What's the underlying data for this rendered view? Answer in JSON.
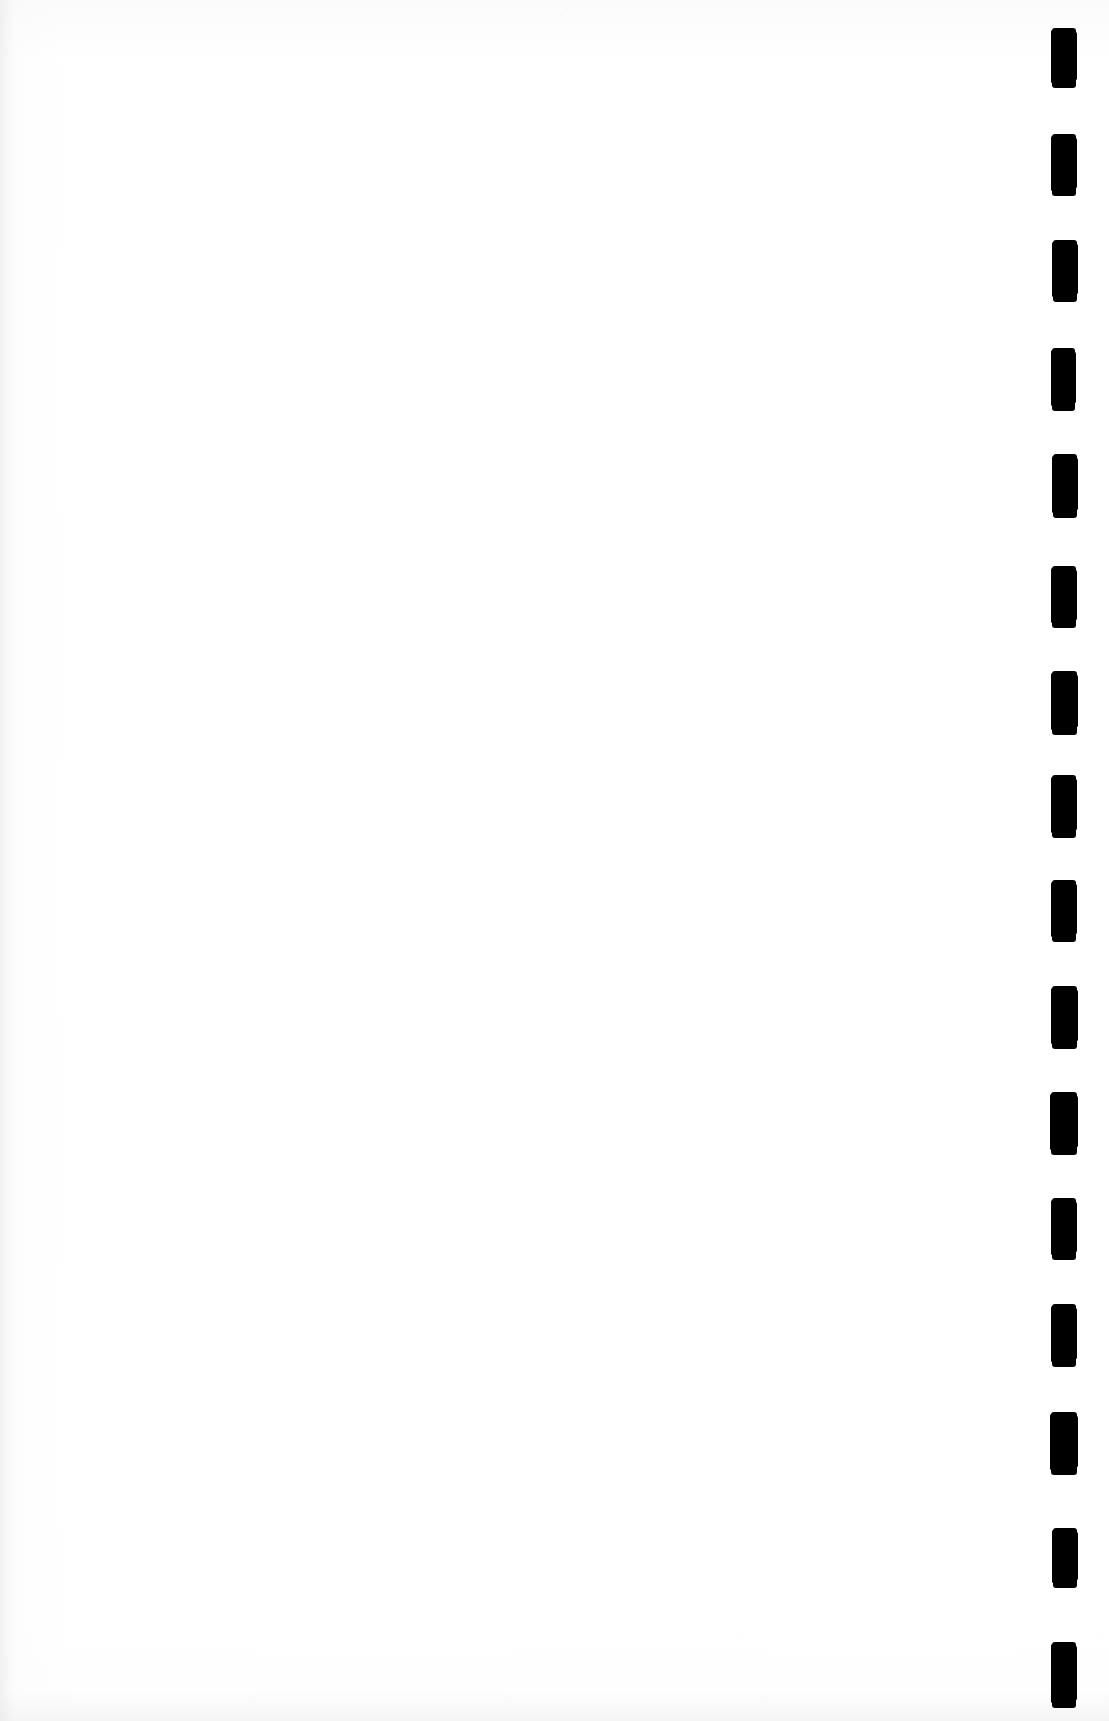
{
  "page": {
    "width": 1109,
    "height": 1721,
    "background_color": "#ffffff",
    "kind": "scanned-document-page",
    "content_text": "",
    "is_blank": true
  },
  "document_body": {
    "name": "blank-page-content",
    "text": ""
  },
  "registration_marks": {
    "name": "edge-registration-marks",
    "count": 16,
    "color": "#000000",
    "orientation": "vertical-column-right-edge",
    "mark_width": 24,
    "mark_height": 62,
    "column_left": 1052,
    "pitch": 105,
    "marks": [
      {
        "index": 1,
        "x": 1052,
        "y": 28,
        "w": 24,
        "h": 60
      },
      {
        "index": 2,
        "x": 1052,
        "y": 134,
        "w": 24,
        "h": 62
      },
      {
        "index": 3,
        "x": 1053,
        "y": 240,
        "w": 24,
        "h": 62
      },
      {
        "index": 4,
        "x": 1052,
        "y": 348,
        "w": 23,
        "h": 63
      },
      {
        "index": 5,
        "x": 1053,
        "y": 454,
        "w": 24,
        "h": 64
      },
      {
        "index": 6,
        "x": 1052,
        "y": 566,
        "w": 24,
        "h": 62
      },
      {
        "index": 7,
        "x": 1052,
        "y": 671,
        "w": 25,
        "h": 64
      },
      {
        "index": 8,
        "x": 1052,
        "y": 775,
        "w": 24,
        "h": 63
      },
      {
        "index": 9,
        "x": 1052,
        "y": 880,
        "w": 24,
        "h": 62
      },
      {
        "index": 10,
        "x": 1052,
        "y": 986,
        "w": 25,
        "h": 63
      },
      {
        "index": 11,
        "x": 1051,
        "y": 1092,
        "w": 26,
        "h": 63
      },
      {
        "index": 12,
        "x": 1052,
        "y": 1198,
        "w": 24,
        "h": 62
      },
      {
        "index": 13,
        "x": 1052,
        "y": 1304,
        "w": 24,
        "h": 63
      },
      {
        "index": 14,
        "x": 1051,
        "y": 1412,
        "w": 26,
        "h": 63
      },
      {
        "index": 15,
        "x": 1053,
        "y": 1528,
        "w": 24,
        "h": 60
      },
      {
        "index": 16,
        "x": 1052,
        "y": 1642,
        "w": 24,
        "h": 66
      }
    ]
  }
}
